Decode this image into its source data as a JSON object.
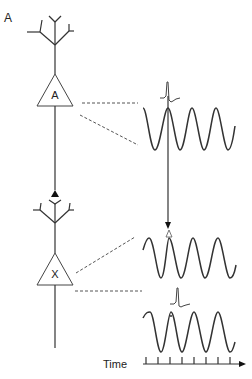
{
  "figure": {
    "panel_label": "A",
    "neurons": [
      {
        "id": "neuron-a",
        "label": "A"
      },
      {
        "id": "neuron-x",
        "label": "X"
      }
    ],
    "time_axis": {
      "label": "Time",
      "tick_count": 8
    },
    "traces": [
      {
        "name": "oscillation-neuron-a",
        "has_spike": true,
        "cycles": 4
      },
      {
        "name": "oscillation-neuron-x-phase-marker",
        "has_spike": false,
        "cycles": 4
      },
      {
        "name": "oscillation-neuron-x",
        "has_spike": true,
        "cycles": 4
      }
    ],
    "colors": {
      "line": "#333333",
      "dash": "#555555",
      "background": "#ffffff"
    }
  }
}
